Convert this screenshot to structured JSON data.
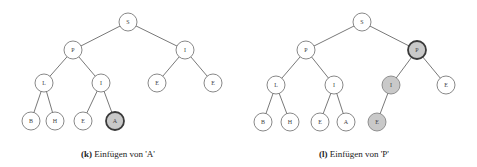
{
  "figures": [
    {
      "id": "k",
      "caption_tag": "(k)",
      "caption_text": "Einfügen von 'A'",
      "caption_pos": [
        118,
        155
      ],
      "nodes": [
        {
          "key": "n1",
          "label": "S",
          "x": 128,
          "y": 22,
          "style": "normal"
        },
        {
          "key": "n2",
          "label": "P",
          "x": 73,
          "y": 50,
          "style": "normal"
        },
        {
          "key": "n3",
          "label": "I",
          "x": 185,
          "y": 50,
          "style": "normal"
        },
        {
          "key": "n4",
          "label": "L",
          "x": 44,
          "y": 83,
          "style": "normal"
        },
        {
          "key": "n5",
          "label": "I",
          "x": 101,
          "y": 83,
          "style": "normal"
        },
        {
          "key": "n6",
          "label": "E",
          "x": 157,
          "y": 83,
          "style": "normal"
        },
        {
          "key": "n7",
          "label": "E",
          "x": 213,
          "y": 83,
          "style": "normal"
        },
        {
          "key": "n8",
          "label": "B",
          "x": 31,
          "y": 121,
          "style": "normal"
        },
        {
          "key": "n9",
          "label": "H",
          "x": 55,
          "y": 121,
          "style": "normal"
        },
        {
          "key": "n10",
          "label": "E",
          "x": 83,
          "y": 121,
          "style": "normal"
        },
        {
          "key": "n11",
          "label": "A",
          "x": 115,
          "y": 121,
          "style": "gray-bold"
        }
      ],
      "edges": [
        [
          "n1",
          "n2"
        ],
        [
          "n1",
          "n3"
        ],
        [
          "n2",
          "n4"
        ],
        [
          "n2",
          "n5"
        ],
        [
          "n3",
          "n6"
        ],
        [
          "n3",
          "n7"
        ],
        [
          "n4",
          "n8"
        ],
        [
          "n4",
          "n9"
        ],
        [
          "n5",
          "n10"
        ],
        [
          "n5",
          "n11"
        ]
      ]
    },
    {
      "id": "l",
      "caption_tag": "(l)",
      "caption_text": "Einfügen von 'P'",
      "caption_pos": [
        354,
        155
      ],
      "nodes": [
        {
          "key": "m1",
          "label": "S",
          "x": 362,
          "y": 22,
          "style": "normal"
        },
        {
          "key": "m2",
          "label": "P",
          "x": 306,
          "y": 50,
          "style": "normal"
        },
        {
          "key": "m3",
          "label": "P",
          "x": 417,
          "y": 50,
          "style": "gray-bold"
        },
        {
          "key": "m4",
          "label": "L",
          "x": 276,
          "y": 85,
          "style": "normal"
        },
        {
          "key": "m5",
          "label": "I",
          "x": 334,
          "y": 85,
          "style": "normal"
        },
        {
          "key": "m6",
          "label": "I",
          "x": 391,
          "y": 85,
          "style": "gray"
        },
        {
          "key": "m7",
          "label": "E",
          "x": 446,
          "y": 85,
          "style": "normal"
        },
        {
          "key": "m8",
          "label": "B",
          "x": 263,
          "y": 122,
          "style": "normal"
        },
        {
          "key": "m9",
          "label": "H",
          "x": 290,
          "y": 122,
          "style": "normal"
        },
        {
          "key": "m10",
          "label": "E",
          "x": 320,
          "y": 122,
          "style": "normal"
        },
        {
          "key": "m11",
          "label": "A",
          "x": 346,
          "y": 122,
          "style": "normal"
        },
        {
          "key": "m12",
          "label": "E",
          "x": 377,
          "y": 122,
          "style": "gray"
        }
      ],
      "edges": [
        [
          "m1",
          "m2"
        ],
        [
          "m1",
          "m3"
        ],
        [
          "m2",
          "m4"
        ],
        [
          "m2",
          "m5"
        ],
        [
          "m3",
          "m6"
        ],
        [
          "m3",
          "m7"
        ],
        [
          "m4",
          "m8"
        ],
        [
          "m4",
          "m9"
        ],
        [
          "m5",
          "m10"
        ],
        [
          "m5",
          "m11"
        ],
        [
          "m6",
          "m12"
        ]
      ]
    }
  ],
  "node_radius": 9,
  "colors": {
    "highlight_fill": "#c9c9c9",
    "node_fill": "#ffffff",
    "edge": "#555555"
  }
}
